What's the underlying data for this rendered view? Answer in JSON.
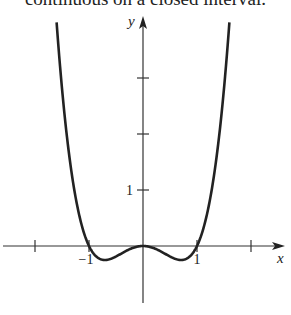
{
  "caption": "continuous on a closed interval.",
  "chart_data": {
    "type": "line",
    "title": "",
    "function": "x^4 - x^2",
    "xlabel": "x",
    "ylabel": "y",
    "xlim": [
      -2.6,
      2.6
    ],
    "ylim": [
      -1.0,
      4.2
    ],
    "x_ticks": [
      -2,
      -1,
      1,
      2
    ],
    "x_tick_labels": [
      {
        "value": -1,
        "label": "−1"
      },
      {
        "value": 1,
        "label": "1"
      }
    ],
    "y_ticks": [
      1,
      2,
      3
    ],
    "y_tick_labels": [
      {
        "value": 1,
        "label": "1"
      }
    ],
    "grid": false,
    "series": [
      {
        "name": "f(x)",
        "x_range": [
          -1.6,
          1.6
        ],
        "points": [
          [
            -1.6,
            4.0
          ],
          [
            -1.4,
            1.88
          ],
          [
            -1.2,
            0.63
          ],
          [
            -1.0,
            0.0
          ],
          [
            -0.707,
            -0.25
          ],
          [
            -0.5,
            -0.19
          ],
          [
            0.0,
            0.0
          ],
          [
            0.5,
            -0.19
          ],
          [
            0.707,
            -0.25
          ],
          [
            1.0,
            0.0
          ],
          [
            1.2,
            0.63
          ],
          [
            1.4,
            1.88
          ],
          [
            1.6,
            4.0
          ]
        ]
      }
    ]
  }
}
